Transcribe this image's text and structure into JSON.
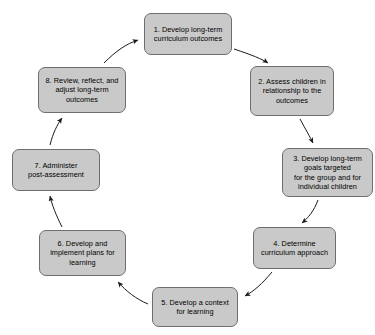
{
  "diagram": {
    "type": "cycle",
    "title": "",
    "node_fill_color": "#c9c9c9",
    "node_border_color": "#6e6e6e",
    "arrow_color": "#1a1a1a",
    "background_color": "#ffffff",
    "direction": "clockwise",
    "nodes": [
      {
        "id": "1",
        "label": "1. Develop long-term\ncurriculum outcomes"
      },
      {
        "id": "2",
        "label": "2. Assess children in\nrelationship to the\noutcomes"
      },
      {
        "id": "3",
        "label": "3. Develop long-term\ngoals targeted\nfor the group and for\nindividual children"
      },
      {
        "id": "4",
        "label": "4. Determine\ncurriculum approach"
      },
      {
        "id": "5",
        "label": "5. Develop a context\nfor learning"
      },
      {
        "id": "6",
        "label": "6. Develop and\nimplement plans for\nlearning"
      },
      {
        "id": "7",
        "label": "7. Administer\npost-assessment"
      },
      {
        "id": "8",
        "label": "8. Review, reflect, and\nadjust long-term\noutcomes"
      }
    ],
    "edges": [
      {
        "from": "1",
        "to": "2"
      },
      {
        "from": "2",
        "to": "3"
      },
      {
        "from": "3",
        "to": "4"
      },
      {
        "from": "4",
        "to": "5"
      },
      {
        "from": "5",
        "to": "6"
      },
      {
        "from": "6",
        "to": "7"
      },
      {
        "from": "7",
        "to": "8"
      },
      {
        "from": "8",
        "to": "1"
      }
    ]
  }
}
